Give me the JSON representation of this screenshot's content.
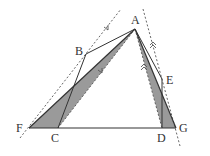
{
  "diagram": {
    "type": "geometry-figure",
    "points": {
      "A": {
        "label": "A",
        "x": 135,
        "y": 29
      },
      "B": {
        "label": "B",
        "x": 86,
        "y": 54
      },
      "E": {
        "label": "E",
        "x": 162,
        "y": 79
      },
      "F": {
        "label": "F",
        "x": 29,
        "y": 128
      },
      "C": {
        "label": "C",
        "x": 58,
        "y": 128
      },
      "D": {
        "label": "D",
        "x": 162,
        "y": 128
      },
      "G": {
        "label": "G",
        "x": 176,
        "y": 128
      }
    },
    "segments": [
      "AB",
      "BC",
      "AE",
      "ED",
      "FG",
      "AF",
      "AG",
      "AC",
      "AD"
    ],
    "shaded_triangles": [
      "AFC",
      "ADG"
    ],
    "dotted_parallels": [
      {
        "through": "A-side-left",
        "parallel_to": "AC",
        "marker": "single-arrow"
      },
      {
        "through": "A-side-right",
        "parallel_to": "AD",
        "marker": "double-arrow"
      }
    ],
    "colors": {
      "line": "#333333",
      "shade": "#9a9a9a",
      "dotted": "#555555"
    }
  }
}
